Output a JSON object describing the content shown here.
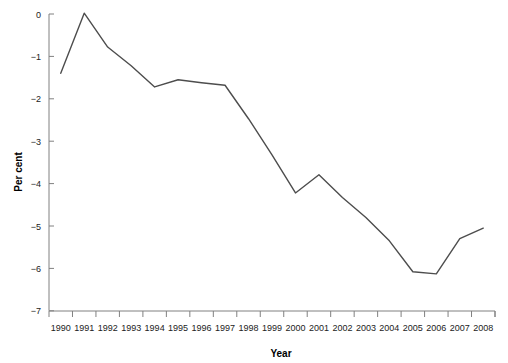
{
  "chart_data": {
    "type": "line",
    "title": "",
    "subtitle": "",
    "xlabel": "Year",
    "ylabel": "Per cent",
    "xlim": [
      1989.5,
      2008.5
    ],
    "ylim": [
      -7,
      0.2
    ],
    "grid": false,
    "legend": null,
    "line_color": "#4d4d4d",
    "line_width": 1.4,
    "axis_color": "#808080",
    "y_ticks": [
      0,
      -1,
      -2,
      -3,
      -4,
      -5,
      -6,
      -7
    ],
    "y_tick_labels": [
      "0",
      "−1",
      "−2",
      "−3",
      "−4",
      "−5",
      "−6",
      "−7"
    ],
    "x_ticks": [
      1990,
      1991,
      1992,
      1993,
      1994,
      1995,
      1996,
      1997,
      1998,
      1999,
      2000,
      2001,
      2002,
      2003,
      2004,
      2005,
      2006,
      2007,
      2008
    ],
    "x_tick_labels": [
      "1990",
      "1991",
      "1992",
      "1993",
      "1994",
      "1995",
      "1996",
      "1997",
      "1998",
      "1999",
      "2000",
      "2001",
      "2002",
      "2003",
      "2004",
      "2005",
      "2006",
      "2007",
      "2008"
    ],
    "x": [
      1990,
      1991,
      1992,
      1993,
      1994,
      1995,
      1996,
      1997,
      1998,
      1999,
      2000,
      2001,
      2002,
      2003,
      2004,
      2005,
      2006,
      2007,
      2008
    ],
    "values": [
      -1.4,
      0.02,
      -0.78,
      -1.22,
      -1.72,
      -1.55,
      -1.62,
      -1.68,
      -2.47,
      -3.32,
      -4.22,
      -3.79,
      -4.33,
      -4.8,
      -5.35,
      -6.08,
      -6.13,
      -5.3,
      -5.05
    ],
    "series": [
      {
        "name": "Per cent",
        "values": [
          -1.4,
          0.02,
          -0.78,
          -1.22,
          -1.72,
          -1.55,
          -1.62,
          -1.68,
          -2.47,
          -3.32,
          -4.22,
          -3.79,
          -4.33,
          -4.8,
          -5.35,
          -6.08,
          -6.13,
          -5.3,
          -5.05
        ]
      }
    ]
  }
}
